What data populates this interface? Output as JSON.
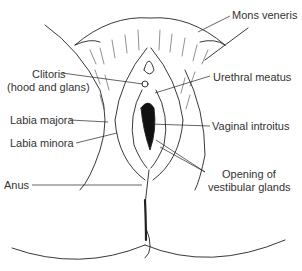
{
  "diagram": {
    "labels": {
      "mons_veneris": "Mons veneris",
      "clitoris_1": "Clitoris",
      "clitoris_2": "(hood and glans)",
      "urethral_meatus": "Urethral meatus",
      "labia_majora": "Labia majora",
      "vaginal_introitus": "Vaginal introitus",
      "labia_minora": "Labia minora",
      "anus": "Anus",
      "vestibular_1": "Opening of",
      "vestibular_2": "vestibular glands"
    },
    "colors": {
      "ink": "#222222",
      "text": "#333333",
      "background": "#ffffff"
    }
  }
}
